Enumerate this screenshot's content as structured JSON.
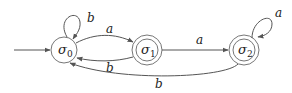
{
  "diagram": {
    "type": "finite-automaton",
    "states": [
      {
        "id": "s0",
        "label": "σ",
        "sub": "0",
        "accepting": false,
        "initial": true
      },
      {
        "id": "s1",
        "label": "σ",
        "sub": "1",
        "accepting": true,
        "initial": false
      },
      {
        "id": "s2",
        "label": "σ",
        "sub": "2",
        "accepting": true,
        "initial": false
      }
    ],
    "transitions": [
      {
        "from": "s0",
        "to": "s0",
        "label": "b"
      },
      {
        "from": "s0",
        "to": "s1",
        "label": "a"
      },
      {
        "from": "s1",
        "to": "s0",
        "label": "b"
      },
      {
        "from": "s1",
        "to": "s2",
        "label": "a"
      },
      {
        "from": "s2",
        "to": "s2",
        "label": "a"
      },
      {
        "from": "s2",
        "to": "s0",
        "label": "b"
      }
    ]
  },
  "labels": {
    "s0": "σ",
    "s0_sub": "0",
    "s1": "σ",
    "s1_sub": "1",
    "s2": "σ",
    "s2_sub": "2",
    "loop_s0": "b",
    "s0_s1": "a",
    "s1_s0": "b",
    "s1_s2": "a",
    "loop_s2": "a",
    "s2_s0": "b"
  }
}
